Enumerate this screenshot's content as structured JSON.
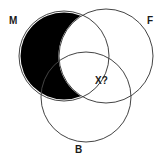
{
  "diagram": {
    "type": "venn",
    "sets": [
      {
        "id": "M",
        "label": "M",
        "cx": 64,
        "cy": 56,
        "r": 45
      },
      {
        "id": "F",
        "label": "F",
        "cx": 106,
        "cy": 56,
        "r": 47
      },
      {
        "id": "B",
        "label": "B",
        "cx": 86,
        "cy": 97,
        "r": 45
      }
    ],
    "shaded_region": "M only (M not F)",
    "shade_color": "#000000",
    "line_color": "#444444",
    "question_label": "X?"
  }
}
